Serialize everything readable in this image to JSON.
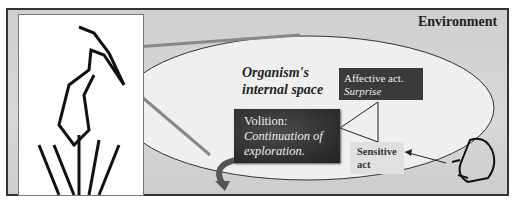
{
  "diagram": {
    "environment_label": "Environment",
    "organism_label_line1": "Organism's",
    "organism_label_line2": "internal space",
    "affective": {
      "title": "Affective act.",
      "subtitle": "Surprise"
    },
    "volition": {
      "title": "Volition:",
      "line1": "Continuation of",
      "line2": "exploration."
    },
    "sensitive": {
      "line1": "Sensitive",
      "line2": "act"
    },
    "icons": {
      "left_figure": "heron-icon",
      "right_figure": "frog-icon"
    },
    "colors": {
      "background": "#d3d3d3",
      "dark_box": "#333333",
      "light_box": "#e0e0e0",
      "ellipse_fill": "#f0f0f0"
    }
  }
}
